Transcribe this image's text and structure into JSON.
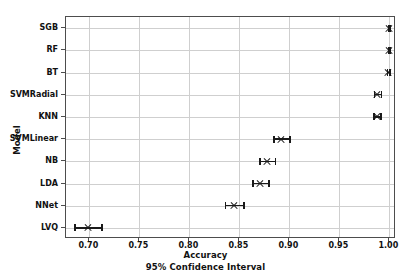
{
  "chart_data": {
    "type": "scatter",
    "title": "",
    "xlabel": "Accuracy",
    "xsublabel": "95% Confidence Interval",
    "ylabel": "Model",
    "xlim": [
      0.6766,
      1.0066
    ],
    "xticks": [
      0.7,
      0.75,
      0.8,
      0.85,
      0.9,
      0.95,
      1.0
    ],
    "xticklabels": [
      "0.70",
      "0.75",
      "0.80",
      "0.85",
      "0.90",
      "0.95",
      "1.00"
    ],
    "grid": true,
    "legend": "none",
    "categories": [
      "SGB",
      "RF",
      "BT",
      "SVMRadial",
      "KNN",
      "SVMLinear",
      "NB",
      "LDA",
      "NNet",
      "LVQ"
    ],
    "points": [
      {
        "model": "SGB",
        "value": 0.9995,
        "lower": 0.9985,
        "upper": 1.0
      },
      {
        "model": "RF",
        "value": 0.9992,
        "lower": 0.9982,
        "upper": 1.0
      },
      {
        "model": "BT",
        "value": 0.9985,
        "lower": 0.9972,
        "upper": 0.9998
      },
      {
        "model": "SVMRadial",
        "value": 0.988,
        "lower": 0.9845,
        "upper": 0.9915
      },
      {
        "model": "KNN",
        "value": 0.9875,
        "lower": 0.984,
        "upper": 0.991
      },
      {
        "model": "SVMLinear",
        "value": 0.892,
        "lower": 0.884,
        "upper": 0.9
      },
      {
        "model": "NB",
        "value": 0.8775,
        "lower": 0.87,
        "upper": 0.8855
      },
      {
        "model": "LDA",
        "value": 0.871,
        "lower": 0.863,
        "upper": 0.879
      },
      {
        "model": "NNet",
        "value": 0.845,
        "lower": 0.8355,
        "upper": 0.854
      },
      {
        "model": "LVQ",
        "value": 0.6985,
        "lower": 0.685,
        "upper": 0.712
      }
    ]
  },
  "colors": {
    "marker": "#1a1a1a",
    "grid": "#cfcfcf",
    "axis": "#4d4d4d",
    "background": "#ffffff"
  }
}
